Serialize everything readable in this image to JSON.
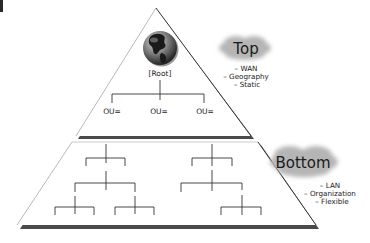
{
  "diagram": {
    "type": "hierarchy-pyramid",
    "top_section": {
      "label": "Top",
      "bullets": [
        "– WAN",
        "– Geography",
        "– Static"
      ],
      "root_label": "[Root]",
      "root_icon": "globe-icon",
      "ou_nodes": [
        "OU=",
        "OU=",
        "OU="
      ]
    },
    "bottom_section": {
      "label": "Bottom",
      "bullets": [
        "– LAN",
        "– Organization",
        "– Flexible"
      ]
    },
    "colors": {
      "outline": "#555555",
      "shadow": "#4a4a4a",
      "cloud": "#b5b5b5",
      "tree_lines": "#333333"
    }
  }
}
